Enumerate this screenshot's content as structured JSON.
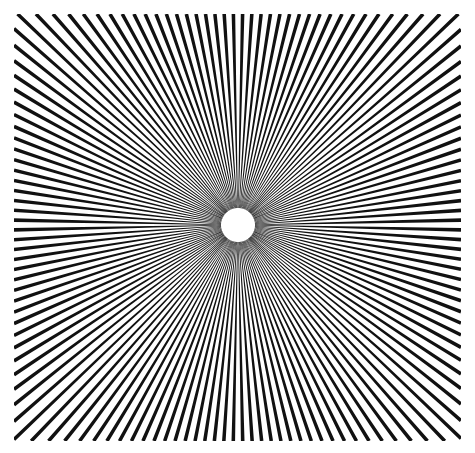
{
  "illustration": {
    "type": "radial-lines-illusion",
    "line_count": 144,
    "center": [
      238,
      225
    ],
    "inner_radius": 17,
    "bounds": {
      "left": 14,
      "top": 14,
      "right": 461,
      "bottom": 441
    },
    "line_color": "#111111",
    "background_color": "#ffffff"
  }
}
